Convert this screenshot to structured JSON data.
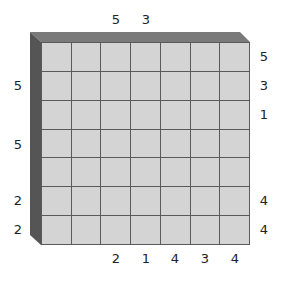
{
  "puzzle": {
    "type": "skyscraper",
    "size": 7,
    "colors": {
      "cell": "#d4d4d4",
      "grid_line": "#5a5a5a",
      "bevel_top": "#7a7a7a",
      "bevel_left": "#555555"
    },
    "clues": {
      "top": [
        "",
        "",
        "5",
        "3",
        "",
        "",
        ""
      ],
      "bottom": [
        "",
        "",
        "2",
        "1",
        "4",
        "3",
        "4"
      ],
      "left": [
        "",
        "5",
        "",
        "5",
        "",
        "2",
        "2"
      ],
      "right": [
        "5",
        "3",
        "1",
        "",
        "",
        "4",
        "4"
      ]
    },
    "cells": [
      [
        "",
        "",
        "",
        "",
        "",
        "",
        ""
      ],
      [
        "",
        "",
        "",
        "",
        "",
        "",
        ""
      ],
      [
        "",
        "",
        "",
        "",
        "",
        "",
        ""
      ],
      [
        "",
        "",
        "",
        "",
        "",
        "",
        ""
      ],
      [
        "",
        "",
        "",
        "",
        "",
        "",
        ""
      ],
      [
        "",
        "",
        "",
        "",
        "",
        "",
        ""
      ],
      [
        "",
        "",
        "",
        "",
        "",
        "",
        ""
      ]
    ]
  }
}
